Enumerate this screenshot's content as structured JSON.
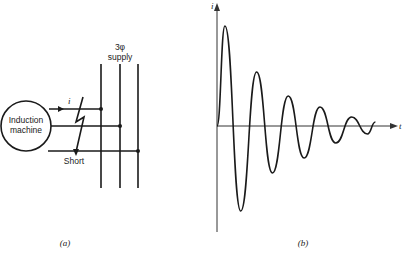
{
  "figure_a": {
    "machine_label_line1": "Induction",
    "machine_label_line2": "machine",
    "supply_label_line1": "3φ",
    "supply_label_line2": "supply",
    "current_label": "i",
    "short_label": "Short",
    "caption": "(a)"
  },
  "figure_b": {
    "y_axis_label": "i",
    "x_axis_label": "t",
    "caption": "(b)",
    "description": "Decaying oscillatory short-circuit current"
  },
  "chart_data": {
    "type": "line",
    "title": "",
    "xlabel": "t",
    "ylabel": "i",
    "grid": false,
    "series": [
      {
        "name": "i(t)",
        "description": "damped sinusoid, approx relative amplitude of extrema",
        "x": [
          0,
          0.09,
          0.27,
          0.45,
          0.63,
          0.81,
          0.99,
          1.17,
          1.35,
          1.53,
          1.71,
          1.8
        ],
        "y": [
          0,
          1.0,
          -0.85,
          0.54,
          -0.47,
          0.3,
          -0.32,
          0.19,
          -0.17,
          0.09,
          -0.08,
          0.04
        ]
      }
    ]
  }
}
